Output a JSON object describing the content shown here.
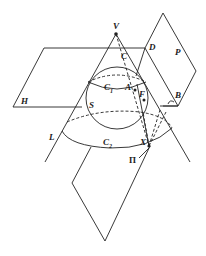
{
  "diagram": {
    "type": "geometry-figure",
    "labels": {
      "V": "V",
      "C": "C",
      "D": "D",
      "P": "P",
      "H": "H",
      "C1": "C",
      "C1_sub": "1",
      "A": "A",
      "F": "F",
      "B": "B",
      "S": "S",
      "L": "L",
      "C2": "C",
      "C2_sub": "2",
      "X": "X",
      "Pi": "Π"
    },
    "colors": {
      "stroke": "#222222",
      "background": "#ffffff"
    }
  }
}
